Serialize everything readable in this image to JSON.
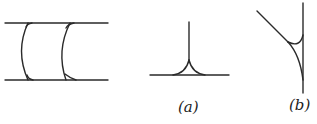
{
  "figure": {
    "stroke_color": "#2a2a2a",
    "panels": [
      {
        "id": "left",
        "label": "",
        "description": "Two parallel horizontal lines joined by two concave-left arcs with small fillets at junctions"
      },
      {
        "id": "a",
        "label": "(a)",
        "description": "Vertical line meeting horizontal line with symmetric cusp fillets"
      },
      {
        "id": "b",
        "label": "(b)",
        "description": "Diagonal line meeting vertical line with curved fillet and small arc"
      }
    ]
  }
}
